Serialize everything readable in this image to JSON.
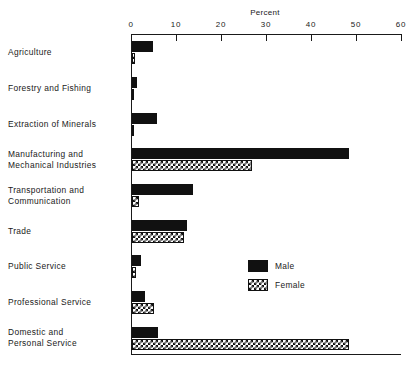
{
  "chart_data": {
    "type": "bar",
    "orientation": "horizontal",
    "title": "",
    "xlabel": "Percent",
    "ylabel": "",
    "xlim": [
      0,
      60
    ],
    "xticks": [
      0,
      10,
      20,
      30,
      40,
      50,
      60
    ],
    "xtick_labels": [
      "0",
      "10",
      "20",
      "30",
      "40",
      "50",
      "60"
    ],
    "grid": false,
    "legend_position": "center-right",
    "categories": [
      "Agriculture",
      "Forestry and Fishing",
      "Extraction of Minerals",
      "Manufacturing and Mechanical Industries",
      "Transportation and Communication",
      "Trade",
      "Public Service",
      "Professional Service",
      "Domestic and Personal Service"
    ],
    "series": [
      {
        "name": "Male",
        "pattern": "solid-black",
        "color": "#111111",
        "values": [
          4.7,
          1.0,
          5.5,
          48.3,
          13.6,
          12.3,
          2.0,
          2.9,
          5.8
        ]
      },
      {
        "name": "Female",
        "pattern": "checkerboard",
        "color": "#111111",
        "values": [
          0.6,
          0.2,
          0.2,
          26.7,
          1.5,
          11.6,
          0.9,
          4.8,
          48.3
        ]
      }
    ]
  },
  "axis": {
    "title": "Percent"
  },
  "legend": {
    "items": [
      {
        "label": "Male",
        "pattern": "solid-black"
      },
      {
        "label": "Female",
        "pattern": "checkerboard"
      }
    ]
  },
  "category_label_lines": [
    [
      "Agriculture"
    ],
    [
      "Forestry and Fishing"
    ],
    [
      "Extraction of Minerals"
    ],
    [
      "Manufacturing and",
      "Mechanical Industries"
    ],
    [
      "Transportation and",
      "Communication"
    ],
    [
      "Trade"
    ],
    [
      "Public Service"
    ],
    [
      "Professional Service"
    ],
    [
      "Domestic and",
      "Personal Service"
    ]
  ]
}
